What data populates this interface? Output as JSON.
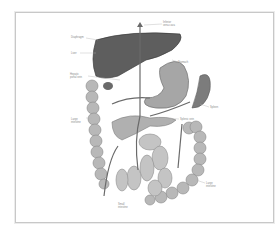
{
  "figure": {
    "labels": [
      {
        "id": "ivc",
        "text": "Inferior\nvena cava",
        "x": 163,
        "y": 21
      },
      {
        "id": "diaphragm",
        "text": "Diaphragm",
        "x": 71,
        "y": 36
      },
      {
        "id": "liver",
        "text": "Liver",
        "x": 71,
        "y": 52
      },
      {
        "id": "stomach",
        "text": "Stomach",
        "x": 178,
        "y": 61
      },
      {
        "id": "hepatic-portal-vein",
        "text": "Hepatic\nportal vein",
        "x": 70,
        "y": 73
      },
      {
        "id": "spleen",
        "text": "Spleen",
        "x": 210,
        "y": 106
      },
      {
        "id": "large-intestine-left",
        "text": "Large\nintestine",
        "x": 71,
        "y": 118
      },
      {
        "id": "splenic-vein",
        "text": "Splenic vein",
        "x": 180,
        "y": 118
      },
      {
        "id": "large-intestine-right",
        "text": "Large\nintestine",
        "x": 206,
        "y": 182
      },
      {
        "id": "small-intestine",
        "text": "Small\nintestine",
        "x": 118,
        "y": 203
      }
    ]
  },
  "colors": {
    "frame": "#c8c8c8",
    "liver": "#5e5e5e",
    "organ": "#9a9a9a",
    "intestine": "#b4b4b4",
    "vessel": "#6a6a6a"
  }
}
